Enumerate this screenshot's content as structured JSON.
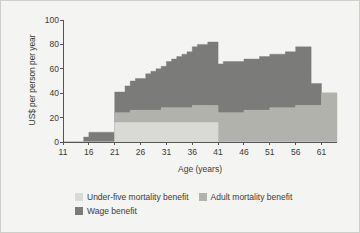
{
  "chart_data": {
    "type": "area",
    "title": "",
    "xlabel": "Age (years)",
    "ylabel": "US$ per person per year",
    "xlim": [
      11,
      64
    ],
    "ylim": [
      0,
      100
    ],
    "xticks": [
      11,
      16,
      21,
      26,
      31,
      36,
      41,
      46,
      51,
      56,
      61
    ],
    "yticks": [
      0,
      20,
      40,
      60,
      80,
      100
    ],
    "grid": false,
    "stacked": true,
    "step": true,
    "legend_position": "below",
    "x": [
      11,
      12,
      13,
      14,
      15,
      16,
      17,
      18,
      19,
      20,
      21,
      22,
      23,
      24,
      25,
      26,
      27,
      28,
      29,
      30,
      31,
      32,
      33,
      34,
      35,
      36,
      37,
      38,
      39,
      40,
      41,
      42,
      43,
      44,
      45,
      46,
      47,
      48,
      49,
      50,
      51,
      52,
      53,
      54,
      55,
      56,
      57,
      58,
      59,
      60,
      61,
      62,
      63,
      64
    ],
    "series": [
      {
        "name": "Under-five mortality benefit",
        "color": "#d9d9d5",
        "values": [
          0,
          0,
          0,
          0,
          0,
          0,
          0,
          0,
          0,
          0,
          16,
          16,
          16,
          16,
          16,
          16,
          16,
          16,
          16,
          16,
          16,
          16,
          16,
          16,
          16,
          16,
          16,
          16,
          16,
          16,
          0,
          0,
          0,
          0,
          0,
          0,
          0,
          0,
          0,
          0,
          0,
          0,
          0,
          0,
          0,
          0,
          0,
          0,
          0,
          0,
          0,
          0,
          0,
          0
        ]
      },
      {
        "name": "Adult mortality benefit",
        "color": "#b2b2ad",
        "values": [
          0,
          0,
          0,
          0,
          0,
          0,
          0,
          0,
          0,
          0,
          8,
          8,
          8,
          10,
          10,
          10,
          10,
          10,
          10,
          12,
          12,
          12,
          12,
          12,
          12,
          14,
          14,
          14,
          14,
          14,
          24,
          24,
          24,
          24,
          24,
          26,
          26,
          26,
          26,
          26,
          28,
          28,
          28,
          28,
          28,
          30,
          30,
          30,
          30,
          30,
          40,
          40,
          40,
          40
        ]
      },
      {
        "name": "Wage benefit",
        "color": "#7b7b79",
        "values": [
          0,
          0,
          0,
          0,
          4,
          8,
          8,
          8,
          8,
          8,
          17,
          17,
          22,
          24,
          26,
          26,
          30,
          32,
          34,
          34,
          38,
          40,
          42,
          44,
          46,
          48,
          50,
          50,
          52,
          52,
          40,
          42,
          42,
          42,
          42,
          42,
          42,
          42,
          44,
          44,
          44,
          44,
          44,
          46,
          46,
          48,
          48,
          48,
          18,
          18,
          0,
          0,
          0,
          0
        ]
      }
    ]
  },
  "legend": {
    "entries": [
      {
        "label": "Under-five mortality benefit",
        "color": "#d9d9d5"
      },
      {
        "label": "Adult mortality benefit",
        "color": "#b2b2ad"
      },
      {
        "label": "Wage benefit",
        "color": "#7b7b79"
      }
    ]
  },
  "axes": {
    "y_title": "US$ per person per year",
    "x_title": "Age (years)",
    "y_tick_labels": [
      "100",
      "80",
      "60",
      "40",
      "20",
      "0"
    ],
    "x_tick_labels": [
      "11",
      "16",
      "21",
      "26",
      "31",
      "36",
      "41",
      "46",
      "51",
      "56",
      "61"
    ]
  },
  "colors": {
    "background": "#f4f4f2",
    "frame": "#cfcfca",
    "axis": "#55555a",
    "text": "#3a3a38"
  }
}
